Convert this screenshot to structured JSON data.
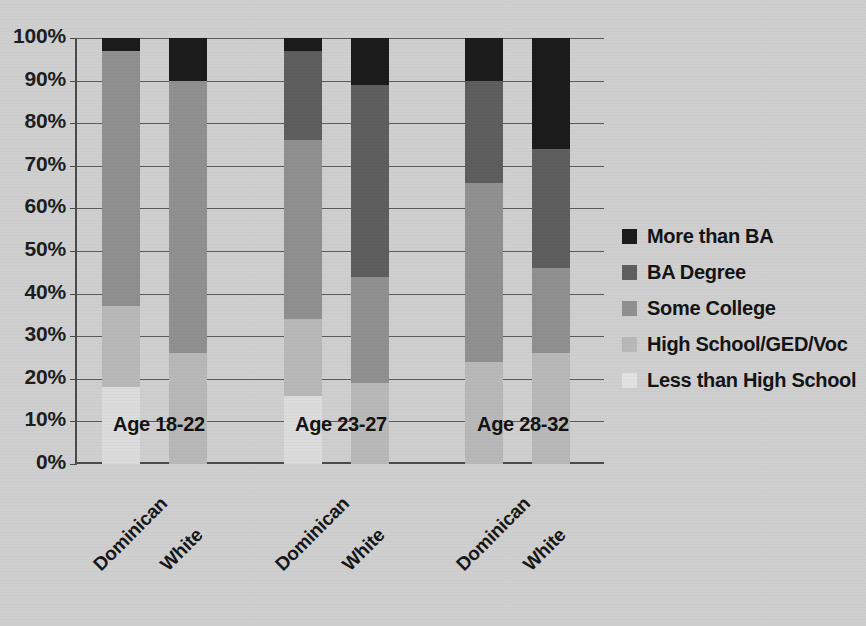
{
  "chart_data": {
    "type": "bar",
    "subtype": "stacked-100-percent",
    "title": "",
    "xlabel": "",
    "ylabel": "",
    "ylim": [
      0,
      100
    ],
    "ytick_labels": [
      "100%",
      "90%",
      "80%",
      "70%",
      "60%",
      "50%",
      "40%",
      "30%",
      "20%",
      "10%",
      "0%"
    ],
    "ytick_values": [
      100,
      90,
      80,
      70,
      60,
      50,
      40,
      30,
      20,
      10,
      0
    ],
    "grid": true,
    "legend_position": "right",
    "group_labels": [
      "Age 18-22",
      "Age 23-27",
      "Age 28-32"
    ],
    "categories": [
      "Dominican",
      "White",
      "Dominican",
      "White",
      "Dominican",
      "White"
    ],
    "series": [
      {
        "name": "More than BA",
        "color": "#1a1a1a",
        "values": [
          3,
          10,
          3,
          11,
          10,
          26
        ]
      },
      {
        "name": "BA Degree",
        "color": "#5d5d5d",
        "values": [
          0,
          0,
          21,
          45,
          24,
          28
        ]
      },
      {
        "name": "Some College",
        "color": "#8f8f8f",
        "values": [
          60,
          64,
          42,
          25,
          42,
          20
        ]
      },
      {
        "name": "High School/GED/Voc",
        "color": "#b8b8b8",
        "values": [
          19,
          26,
          18,
          19,
          24,
          26
        ]
      },
      {
        "name": "Less than High School",
        "color": "#dcdcdc",
        "values": [
          18,
          0,
          16,
          0,
          0,
          0
        ]
      }
    ]
  },
  "legend": {
    "items": [
      {
        "label": "More than BA",
        "color": "#1a1a1a"
      },
      {
        "label": "BA Degree",
        "color": "#5d5d5d"
      },
      {
        "label": "Some College",
        "color": "#8f8f8f"
      },
      {
        "label": "High School/GED/Voc",
        "color": "#b8b8b8"
      },
      {
        "label": "Less than High School",
        "color": "#e2e2e2"
      }
    ]
  },
  "axis": {
    "y_ticks": [
      "100%",
      "90%",
      "80%",
      "70%",
      "60%",
      "50%",
      "40%",
      "30%",
      "20%",
      "10%",
      "0%"
    ],
    "x_ticks": [
      "Dominican",
      "White",
      "Dominican",
      "White",
      "Dominican",
      "White"
    ]
  },
  "groups": {
    "labels": [
      "Age 18-22",
      "Age 23-27",
      "Age 28-32"
    ]
  }
}
